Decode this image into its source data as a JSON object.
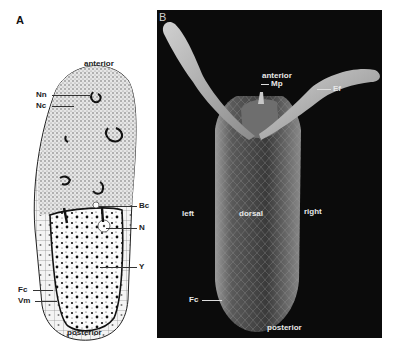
{
  "figure": {
    "panel_a": {
      "letter": "A",
      "type": "schematic drawing of egg chamber (longitudinal section)",
      "labels": {
        "top": "anterior",
        "bottom": "posterior",
        "Nn": "Nn",
        "Nc": "Nc",
        "Bc": "Bc",
        "N": "N",
        "Y": "Y",
        "Fc": "Fc",
        "Vm": "Vm"
      }
    },
    "panel_b": {
      "letter": "B",
      "type": "scanning electron micrograph of egg, dorsal view",
      "labels": {
        "top": "anterior",
        "Mp": "Mp",
        "Ef": "Ef",
        "left": "left",
        "center": "dorsal",
        "right": "right",
        "Fc": "Fc",
        "bottom": "posterior"
      }
    },
    "colors": {
      "background": "#ffffff",
      "sem_background": "#0b0b0b",
      "ink": "#222222",
      "label_light": "#e8e8e8"
    }
  }
}
